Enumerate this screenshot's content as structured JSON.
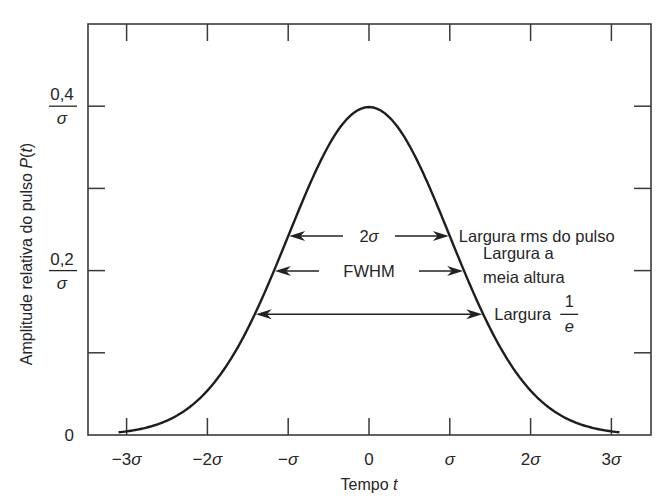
{
  "chart_data": {
    "type": "line",
    "title": "",
    "xlabel": "Tempo t",
    "xlabel_parts": {
      "text": "Tempo ",
      "var": "t"
    },
    "ylabel": "Amplitude relativa do pulso P(t)",
    "ylabel_parts": {
      "text": "Amplitude relativa do pulso ",
      "var": "P",
      "suffix_open": "(",
      "suffix_var": "t",
      "suffix_close": ")"
    },
    "x_unit": "σ",
    "xlim": [
      -3.6,
      3.35
    ],
    "ylim": [
      0,
      0.5
    ],
    "grid": false,
    "legend": "none",
    "x_ticks": [
      {
        "value": -3,
        "label": "−3σ"
      },
      {
        "value": -2,
        "label": "−2σ"
      },
      {
        "value": -1,
        "label": "−σ"
      },
      {
        "value": 0,
        "label": "0"
      },
      {
        "value": 1,
        "label": "σ"
      },
      {
        "value": 2,
        "label": "2σ"
      },
      {
        "value": 3,
        "label": "3σ"
      }
    ],
    "y_ticks": [
      {
        "value": 0,
        "label": "0"
      },
      {
        "value": 0.1,
        "label": ""
      },
      {
        "value": 0.2,
        "label_num": "0,2",
        "label_den": "σ"
      },
      {
        "value": 0.3,
        "label": ""
      },
      {
        "value": 0.4,
        "label_num": "0,4",
        "label_den": "σ"
      }
    ],
    "series": [
      {
        "name": "Gaussian pulse P(t)",
        "function": "exp(-t^2/(2σ^2)) / (σ·sqrt(2π))",
        "x_range": [
          -3.1,
          3.1
        ],
        "peak": {
          "x": 0,
          "y": 0.399
        }
      }
    ],
    "annotations": [
      {
        "name": "rms-width",
        "label": "2σ",
        "y": 0.242,
        "half_width": 1.0,
        "side_text": [
          "Largura rms do pulso"
        ]
      },
      {
        "name": "fwhm",
        "label": "FWHM",
        "y": 0.1995,
        "half_width": 1.177,
        "side_text": [
          "Largura a",
          "meia altura"
        ]
      },
      {
        "name": "one-over-e-width",
        "label": "",
        "y": 0.1468,
        "half_width": 1.414,
        "side_text": [
          "Largura"
        ],
        "fraction": {
          "num": "1",
          "den": "e"
        }
      }
    ]
  }
}
